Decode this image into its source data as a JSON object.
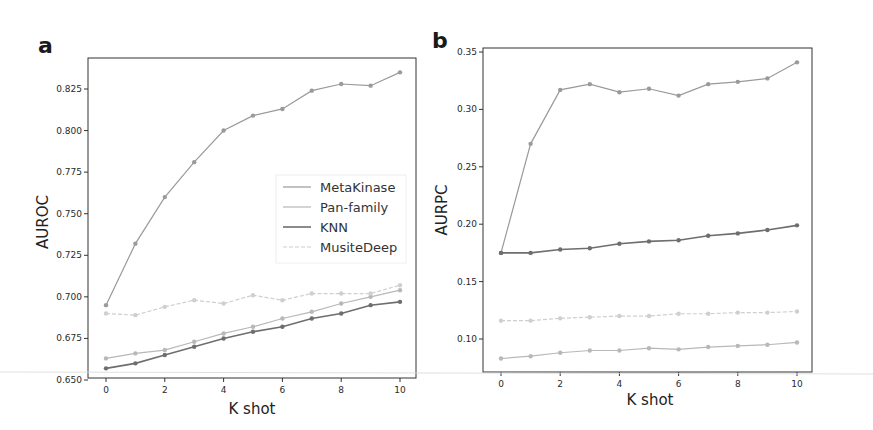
{
  "chart_data": [
    {
      "panel": "a",
      "type": "line",
      "title": "",
      "xlabel": "K shot",
      "ylabel": "AUROC",
      "x": [
        0,
        1,
        2,
        3,
        4,
        5,
        6,
        7,
        8,
        9,
        10
      ],
      "xticks": [
        "0",
        "2",
        "4",
        "6",
        "8",
        "10"
      ],
      "yticks": [
        "0.650",
        "0.675",
        "0.700",
        "0.725",
        "0.750",
        "0.775",
        "0.800",
        "0.825"
      ],
      "ylim": [
        0.65,
        0.84
      ],
      "grid": false,
      "legend_position": "center right",
      "series": [
        {
          "name": "MetaKinase",
          "color": "#9a9a9a",
          "dash": "",
          "values": [
            0.695,
            0.732,
            0.76,
            0.781,
            0.8,
            0.809,
            0.813,
            0.824,
            0.828,
            0.827,
            0.835
          ]
        },
        {
          "name": "Pan-family",
          "color": "#b8b8b8",
          "dash": "",
          "values": [
            0.663,
            0.666,
            0.668,
            0.673,
            0.678,
            0.682,
            0.687,
            0.691,
            0.696,
            0.7,
            0.704
          ]
        },
        {
          "name": "KNN",
          "color": "#6e6e6e",
          "dash": "",
          "values": [
            0.657,
            0.66,
            0.665,
            0.67,
            0.675,
            0.679,
            0.682,
            0.687,
            0.69,
            0.695,
            0.697
          ]
        },
        {
          "name": "MusiteDeep",
          "color": "#cfcfcf",
          "dash": "4,2",
          "values": [
            0.69,
            0.689,
            0.694,
            0.698,
            0.696,
            0.701,
            0.698,
            0.702,
            0.702,
            0.702,
            0.707
          ]
        }
      ]
    },
    {
      "panel": "b",
      "type": "line",
      "title": "",
      "xlabel": "K shot",
      "ylabel": "AURPC",
      "x": [
        0,
        1,
        2,
        3,
        4,
        5,
        6,
        7,
        8,
        9,
        10
      ],
      "xticks": [
        "0",
        "2",
        "4",
        "6",
        "8",
        "10"
      ],
      "yticks": [
        "0.10",
        "0.15",
        "0.20",
        "0.25",
        "0.30",
        "0.35"
      ],
      "ylim": [
        0.072,
        0.35
      ],
      "grid": false,
      "series": [
        {
          "name": "MetaKinase",
          "color": "#9a9a9a",
          "dash": "",
          "values": [
            0.175,
            0.27,
            0.317,
            0.322,
            0.315,
            0.318,
            0.312,
            0.322,
            0.324,
            0.327,
            0.341
          ]
        },
        {
          "name": "Pan-family",
          "color": "#b8b8b8",
          "dash": "",
          "values": [
            0.083,
            0.085,
            0.088,
            0.09,
            0.09,
            0.092,
            0.091,
            0.093,
            0.094,
            0.095,
            0.097
          ]
        },
        {
          "name": "KNN",
          "color": "#6e6e6e",
          "dash": "",
          "values": [
            0.175,
            0.175,
            0.178,
            0.179,
            0.183,
            0.185,
            0.186,
            0.19,
            0.192,
            0.195,
            0.199
          ]
        },
        {
          "name": "MusiteDeep",
          "color": "#cfcfcf",
          "dash": "4,2",
          "values": [
            0.116,
            0.116,
            0.118,
            0.119,
            0.12,
            0.12,
            0.122,
            0.122,
            0.123,
            0.123,
            0.124
          ]
        }
      ]
    }
  ],
  "panels": {
    "a": {
      "letter": "a",
      "xlabel": "K shot",
      "ylabel": "AUROC"
    },
    "b": {
      "letter": "b",
      "xlabel": "K shot",
      "ylabel": "AURPC"
    }
  },
  "legend": {
    "items": [
      "MetaKinase",
      "Pan-family",
      "KNN",
      "MusiteDeep"
    ]
  }
}
